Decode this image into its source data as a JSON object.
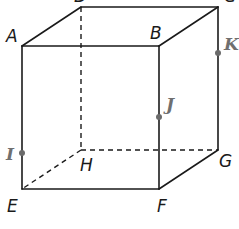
{
  "figure": {
    "type": "cube",
    "vertices": {
      "A": {
        "label": "A",
        "x": 22,
        "y": 46
      },
      "B": {
        "label": "B",
        "x": 159,
        "y": 46
      },
      "C": {
        "label": "C",
        "x": 218,
        "y": 7
      },
      "D": {
        "label": "D",
        "x": 81,
        "y": 7
      },
      "E": {
        "label": "E",
        "x": 22,
        "y": 189
      },
      "F": {
        "label": "F",
        "x": 159,
        "y": 189
      },
      "G": {
        "label": "G",
        "x": 218,
        "y": 150
      },
      "H": {
        "label": "H",
        "x": 81,
        "y": 150
      }
    },
    "points": {
      "I": {
        "label": "I",
        "on_edge": "AE",
        "x": 22,
        "y": 153
      },
      "J": {
        "label": "J",
        "on_edge": "BF",
        "x": 159,
        "y": 117
      },
      "K": {
        "label": "K",
        "on_edge": "CG",
        "x": 218,
        "y": 53
      }
    },
    "visible_edges": [
      "AB",
      "BF",
      "FE",
      "EA",
      "DC",
      "AD",
      "BC",
      "CG",
      "FG"
    ],
    "hidden_edges": [
      "DH",
      "HE",
      "HG"
    ]
  }
}
